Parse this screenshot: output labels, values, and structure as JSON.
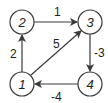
{
  "nodes": [
    {
      "id": "1",
      "label": "1",
      "cx": 22,
      "cy": 84
    },
    {
      "id": "2",
      "label": "2",
      "cx": 22,
      "cy": 22
    },
    {
      "id": "3",
      "label": "3",
      "cx": 90,
      "cy": 22
    },
    {
      "id": "4",
      "label": "4",
      "cx": 90,
      "cy": 84
    }
  ],
  "edges": [
    {
      "from": "1",
      "to": "2",
      "weight": "2"
    },
    {
      "from": "2",
      "to": "3",
      "weight": "1"
    },
    {
      "from": "1",
      "to": "3",
      "weight": "5"
    },
    {
      "from": "3",
      "to": "4",
      "weight": "-3"
    },
    {
      "from": "4",
      "to": "1",
      "weight": "-4"
    }
  ],
  "colors": {
    "stroke": "#3a3a3a",
    "text": "#222222",
    "background": "#ffffff"
  }
}
